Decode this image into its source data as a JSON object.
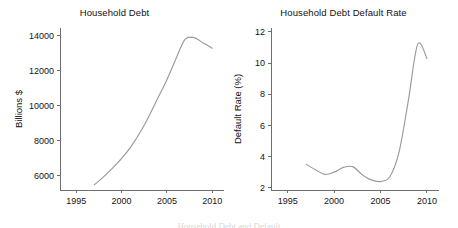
{
  "figure": {
    "background_color": "#ffffff",
    "line_color": "#9a9a9a",
    "axis_color": "#6e6e6e",
    "clipped_caption": "Household Debt and Default"
  },
  "chart_data": [
    {
      "type": "line",
      "panel": "left",
      "title": "Household Debt",
      "xlabel": "",
      "ylabel": "Billions $",
      "xlim": [
        1993.2,
        2011.3
      ],
      "ylim": [
        5200,
        14450
      ],
      "xticks": [
        1995,
        2000,
        2005,
        2010
      ],
      "yticks": [
        6000,
        8000,
        10000,
        12000,
        14000
      ],
      "xtick_labels": [
        "1995",
        "2000",
        "2005",
        "2010"
      ],
      "ytick_labels": [
        "6000",
        "8000",
        "10000",
        "12000",
        "14000"
      ],
      "grid": false,
      "legend": "none",
      "series": [
        {
          "name": "Household Debt",
          "color": "#9a9a9a",
          "x": [
            1997,
            1998,
            1999,
            2000,
            2001,
            2002,
            2003,
            2004,
            2005,
            2006,
            2007,
            2008,
            2009,
            2010
          ],
          "values": [
            5500,
            5950,
            6450,
            7000,
            7650,
            8450,
            9400,
            10450,
            11500,
            12700,
            13800,
            13900,
            13600,
            13300
          ]
        }
      ]
    },
    {
      "type": "line",
      "panel": "right",
      "title": "Household Debt Default Rate",
      "xlabel": "",
      "ylabel": "Default Rate (%)",
      "xlim": [
        1993.2,
        2011.3
      ],
      "ylim": [
        1.85,
        12.25
      ],
      "xticks": [
        1995,
        2000,
        2005,
        2010
      ],
      "yticks": [
        2,
        4,
        6,
        8,
        10,
        12
      ],
      "xtick_labels": [
        "1995",
        "2000",
        "2005",
        "2010"
      ],
      "ytick_labels": [
        "2",
        "4",
        "6",
        "8",
        "10",
        "12"
      ],
      "grid": false,
      "legend": "none",
      "series": [
        {
          "name": "Default Rate",
          "color": "#9a9a9a",
          "x": [
            1997,
            1998,
            1999,
            2000,
            2001,
            2002,
            2003,
            2004,
            2005,
            2006,
            2007,
            2008,
            2009,
            2010
          ],
          "values": [
            3.5,
            3.15,
            2.85,
            3.0,
            3.3,
            3.35,
            2.85,
            2.5,
            2.4,
            2.7,
            4.3,
            7.6,
            11.2,
            10.3
          ]
        }
      ]
    }
  ]
}
